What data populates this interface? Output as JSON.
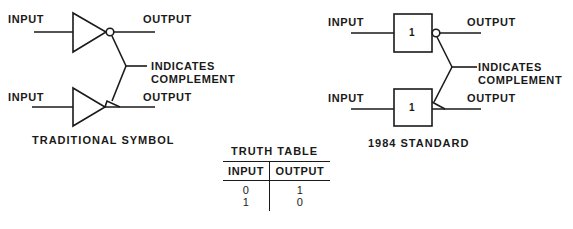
{
  "figure": {
    "left_panel": {
      "caption": "TRADITIONAL SYMBOL",
      "top_gate": {
        "input_label": "INPUT",
        "output_label": "OUTPUT",
        "symbol": "triangle-with-bubble"
      },
      "bottom_gate": {
        "input_label": "INPUT",
        "output_label": "OUTPUT",
        "symbol": "triangle-with-polarity-indicator"
      },
      "annotation": {
        "line1": "INDICATES",
        "line2": "COMPLEMENT"
      }
    },
    "right_panel": {
      "caption": "1984 STANDARD",
      "top_gate": {
        "input_label": "INPUT",
        "output_label": "OUTPUT",
        "box_label": "1",
        "symbol": "box-with-bubble"
      },
      "bottom_gate": {
        "input_label": "INPUT",
        "output_label": "OUTPUT",
        "box_label": "1",
        "symbol": "box-with-polarity-indicator"
      },
      "annotation": {
        "line1": "INDICATES",
        "line2": "COMPLEMENT"
      }
    },
    "truth_table": {
      "title": "TRUTH TABLE",
      "headers": [
        "INPUT",
        "OUTPUT"
      ],
      "rows": [
        [
          "0",
          "1"
        ],
        [
          "1",
          "0"
        ]
      ]
    }
  }
}
